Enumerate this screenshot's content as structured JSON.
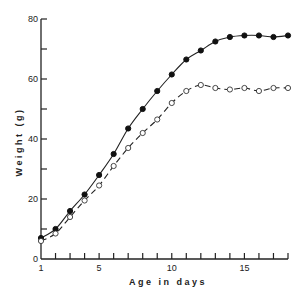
{
  "chart_data": {
    "type": "line",
    "title": "",
    "xlabel": "Age in days",
    "ylabel": "Weight (g)",
    "xlim": [
      1,
      18
    ],
    "ylim": [
      0,
      80
    ],
    "x_ticks": [
      1,
      2,
      3,
      4,
      5,
      6,
      7,
      8,
      9,
      10,
      11,
      12,
      13,
      14,
      15,
      16,
      17,
      18
    ],
    "x_tick_labels": [
      {
        "value": 1,
        "label": "1"
      },
      {
        "value": 5,
        "label": "5"
      },
      {
        "value": 10,
        "label": "10"
      },
      {
        "value": 15,
        "label": "15"
      }
    ],
    "y_ticks": [
      0,
      10,
      20,
      30,
      40,
      50,
      60,
      70,
      80
    ],
    "y_tick_labels": [
      {
        "value": 0,
        "label": "0"
      },
      {
        "value": 20,
        "label": "20"
      },
      {
        "value": 40,
        "label": "40"
      },
      {
        "value": 60,
        "label": "60"
      },
      {
        "value": 80,
        "label": "80"
      }
    ],
    "grid": false,
    "legend": null,
    "x": [
      1,
      2,
      3,
      4,
      5,
      6,
      7,
      8,
      9,
      10,
      11,
      12,
      13,
      14,
      15,
      16,
      17,
      18
    ],
    "series": [
      {
        "name": "filled circles (solid line)",
        "marker": "filled-circle",
        "line_style": "solid",
        "values": [
          7,
          10,
          16,
          21.5,
          28,
          35,
          43.5,
          50,
          56,
          61.5,
          66.5,
          69.5,
          72.5,
          74,
          74.5,
          74.5,
          74,
          74.5
        ]
      },
      {
        "name": "open circles (dashed line)",
        "marker": "open-circle",
        "line_style": "dashed",
        "values": [
          6,
          8.5,
          14,
          19.5,
          24.5,
          31,
          37,
          42,
          46.5,
          52,
          56,
          58,
          57,
          56.5,
          57,
          56,
          57,
          57
        ]
      }
    ]
  }
}
